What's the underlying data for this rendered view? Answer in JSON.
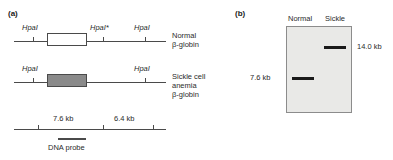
{
  "panels": {
    "a": {
      "label": "(a)",
      "maps": [
        {
          "name": "normal",
          "gene_label_lines": [
            "Normal",
            "β-globin"
          ],
          "sites": [
            "HpaI",
            "HpaI*",
            "HpaI"
          ]
        },
        {
          "name": "sickle",
          "gene_label_lines": [
            "Sickle cell",
            "anemia",
            "β-globin"
          ],
          "sites": [
            "HpaI",
            "HpaI"
          ]
        }
      ],
      "ruler": {
        "distances": [
          "7.6 kb",
          "6.4 kb"
        ],
        "probe_label": "DNA probe"
      }
    },
    "b": {
      "label": "(b)",
      "lanes": [
        "Normal",
        "Sickle"
      ],
      "bands": [
        {
          "lane": "Sickle",
          "size": "14.0 kb"
        },
        {
          "lane": "Normal",
          "size": "7.6 kb"
        }
      ]
    }
  },
  "colors": {
    "line": "#4a4a4a",
    "mutant_box": "#8a8a8a",
    "blot_background": "#e9e9e7",
    "band": "#1a1a1a"
  }
}
